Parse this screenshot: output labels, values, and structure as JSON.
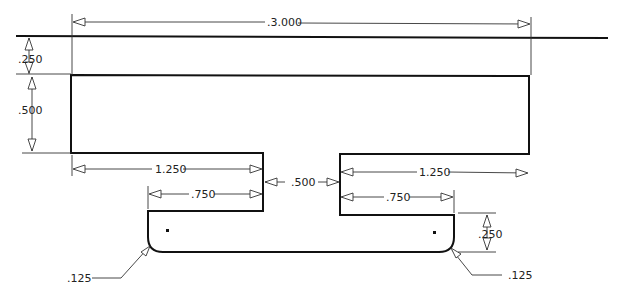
{
  "drawing": {
    "dimensions": {
      "overall_width": ".3.000",
      "top_offset": ".250",
      "rect_height": ".500",
      "left_flange": "1.250",
      "right_flange": "1.250",
      "left_inner": ".750",
      "right_inner": ".750",
      "gap": ".500",
      "lower_height": ".250",
      "fillet_left": ".125",
      "fillet_right": ".125"
    }
  }
}
